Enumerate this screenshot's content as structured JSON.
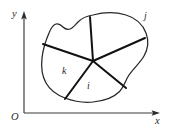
{
  "figure": {
    "type": "geometry-diagram",
    "background_color": "#ffffff",
    "axes": {
      "origin_label": "O",
      "x_axis_label": "x",
      "y_axis_label": "y",
      "axis_color": "#3a3a3a",
      "origin_px": {
        "x": 24,
        "y": 113
      },
      "x_axis_end_px": {
        "x": 158,
        "y": 113
      },
      "y_axis_end_px": {
        "x": 24,
        "y": 14
      }
    },
    "region": {
      "outline_color": "#262626",
      "fill_color": "#ffffff",
      "center_px": {
        "x": 93,
        "y": 61
      },
      "partition_color": "#111111",
      "partition_count": 5
    },
    "labels": [
      {
        "id": "label-j",
        "text": "j",
        "kind": "region-label",
        "x": 144,
        "y": 11
      },
      {
        "id": "label-k",
        "text": "k",
        "kind": "region-label",
        "x": 62,
        "y": 66
      },
      {
        "id": "label-i",
        "text": "i",
        "kind": "region-label",
        "x": 87,
        "y": 81
      },
      {
        "id": "label-y",
        "text": "y",
        "kind": "axis-label",
        "x": 12,
        "y": 9
      },
      {
        "id": "label-O",
        "text": "O",
        "kind": "axis-label",
        "x": 11,
        "y": 112
      },
      {
        "id": "label-x",
        "text": "x",
        "kind": "axis-label",
        "x": 155,
        "y": 116
      }
    ],
    "label_text": {
      "y": "y",
      "x": "x",
      "O": "O",
      "j": "j",
      "k": "k",
      "i": "i"
    }
  }
}
